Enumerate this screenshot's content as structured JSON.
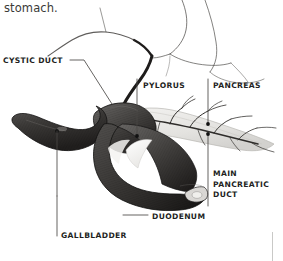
{
  "figure": {
    "background_color": "#ffffff",
    "width": 283,
    "height": 261
  },
  "caption": {
    "text": "stomach.",
    "color": "#3a3a38"
  },
  "labels": [
    {
      "id": "cystic-duct",
      "text": "CYSTIC DUCT",
      "x": 3,
      "y": 56,
      "leader": "diagonal-down-right",
      "color": "#231f1e"
    },
    {
      "id": "pylorus",
      "text": "PYLORUS",
      "x": 143,
      "y": 81,
      "leader": "vertical-down",
      "color": "#231f1e"
    },
    {
      "id": "pancreas",
      "text": "PANCREAS",
      "x": 213,
      "y": 81,
      "leader": "vertical-down",
      "color": "#231f1e"
    },
    {
      "id": "main-pancreatic-duct",
      "line1": "MAIN",
      "line2": "PANCREATIC",
      "line3": "DUCT",
      "x": 213,
      "y": 169,
      "leader": "vertical-up",
      "color": "#231f1e"
    },
    {
      "id": "duodenum",
      "text": "DUODENUM",
      "x": 152,
      "y": 212,
      "leader": "horizontal-left",
      "color": "#231f1e"
    },
    {
      "id": "gallbladder",
      "text": "GALLBLADDER",
      "x": 61,
      "y": 231,
      "leader": "vertical-up",
      "color": "#231f1e"
    }
  ],
  "artwork": {
    "organs": [
      {
        "name": "gallbladder",
        "shape": "pear",
        "tone": "dark-grey"
      },
      {
        "name": "duodenum",
        "shape": "c-loop",
        "tone": "dark-grey"
      },
      {
        "name": "pancreas",
        "shape": "tapering-body",
        "tone": "light-grey"
      },
      {
        "name": "pylorus",
        "shape": "stomach-outlet",
        "tone": "dark-grey"
      },
      {
        "name": "common-bile-duct",
        "shape": "line-art-duct",
        "tone": "outline"
      },
      {
        "name": "main-pancreatic-duct",
        "shape": "branching-duct",
        "tone": "outline"
      }
    ],
    "leader_dot_color": "#111111",
    "leader_line_color": "#5a5a58",
    "outline_color": "#2a2a28"
  }
}
